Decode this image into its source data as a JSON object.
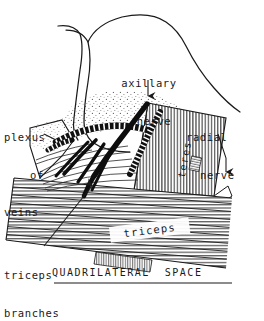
{
  "figure": {
    "title": "QUADRILATERAL  SPACE",
    "title_underlined": true,
    "background_color": "#ffffff",
    "ink_color": "#1a1a1a",
    "style": "pen-and-ink anatomical line drawing with hatching and stipple"
  },
  "labels": {
    "axillary_nerve": {
      "line1": "axillary",
      "line2": "nerve"
    },
    "radial_nerve": {
      "line1": "radial",
      "line2": "nerve"
    },
    "plexus_of_veins": {
      "line1": "plexus",
      "line2": "of",
      "line3": "veins"
    },
    "triceps_branches": {
      "line1": "triceps",
      "line2": "branches"
    },
    "teres": "teres",
    "triceps": "triceps"
  },
  "structures": [
    {
      "name": "humeral-head",
      "label": "",
      "shading": "outline-and-stipple"
    },
    {
      "name": "teres-muscle",
      "label": "teres",
      "shading": "vertical-hatching"
    },
    {
      "name": "triceps-muscle",
      "label": "triceps",
      "shading": "horizontal-hatching"
    },
    {
      "name": "vein-plexus",
      "label": "plexus of veins",
      "shading": "beaded-segments"
    },
    {
      "name": "axillary-nerve",
      "label": "axillary nerve",
      "shading": "solid-black"
    },
    {
      "name": "radial-nerve",
      "label": "radial nerve",
      "shading": "solid-black"
    },
    {
      "name": "triceps-branches",
      "label": "triceps branches",
      "shading": "solid-black"
    }
  ],
  "leaders": [
    {
      "name": "axillary-nerve-leader",
      "arrow": "down"
    },
    {
      "name": "radial-nerve-leader",
      "arrow": "down"
    },
    {
      "name": "plexus-leader",
      "arrow": "none"
    },
    {
      "name": "triceps-branches-leader",
      "arrow": "up-right"
    }
  ]
}
